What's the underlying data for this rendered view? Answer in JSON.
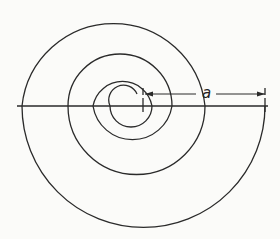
{
  "diagram": {
    "type": "spiral of semicircles",
    "dimension_label": "a",
    "colors": {
      "stroke": "#2a2a2a",
      "background": "#fbfbf9"
    },
    "axis": {
      "x1": 17,
      "x2": 268,
      "y": 106
    },
    "dimension": {
      "x1": 145,
      "x2": 265,
      "y": 94,
      "label_x": 202,
      "label_y": 86
    },
    "ticks": [
      {
        "x": 143,
        "y1": 88,
        "y2": 113
      },
      {
        "x": 265,
        "y1": 88,
        "y2": 112
      }
    ],
    "arcs": [
      "M 137 94 A 14 14 0 0 0 110 106",
      "M 110 106 A 21 21 0 0 0 152 106",
      "M 152 106 A 30 30 0 0 0 93 106",
      "M 93 106 A 40 40 0 0 0 172 106",
      "M 172 106 A 52 52 0 0 0 68 106",
      "M 68 106 A 68 68 0 0 0 205 106",
      "M 205 106 A 92 92 0 0 0 22 106",
      "M 22 106 A 121.5 121.5 0 0 0 265 106"
    ]
  }
}
